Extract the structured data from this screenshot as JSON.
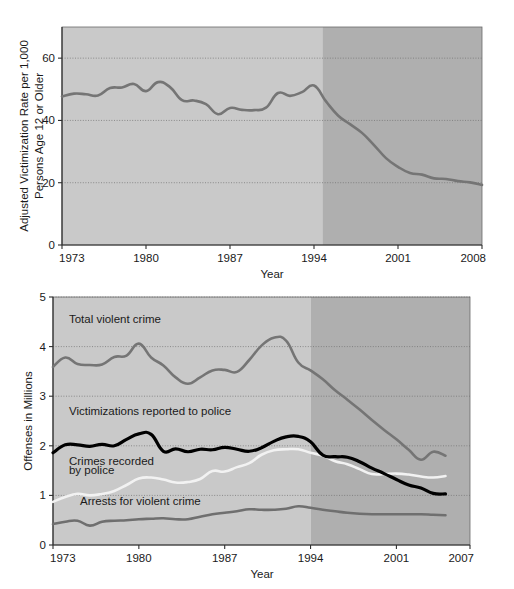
{
  "figure": {
    "title": "",
    "background": "#ffffff"
  },
  "colors": {
    "light_shade": "#c9c9c9",
    "dark_shade": "#afafaf",
    "axis": "#3a3a3a",
    "grid": "#8a8a8a",
    "line_gray": "#757575",
    "line_black": "#000000",
    "line_white": "#f2f2f2",
    "line_darkgray": "#6f6f6f"
  },
  "chart_data": [
    {
      "id": "top",
      "type": "line",
      "title": "",
      "xlabel": "Year",
      "ylabel": "Adjusted Victimization Rate per 1,000\nPersons Age 12 or Older",
      "ylabel_line1": "Adjusted Victimization Rate per 1,000",
      "ylabel_line2": "Persons Age 12 or Older",
      "xlim": [
        1973,
        2008
      ],
      "ylim": [
        0,
        70
      ],
      "xticks": [
        1973,
        1980,
        1987,
        1994,
        2001,
        2008
      ],
      "xticklabels": [
        "1973",
        "1980",
        "1987",
        "1994",
        "2001",
        "2008"
      ],
      "yticks": [
        0,
        20,
        40,
        60
      ],
      "yticklabels": [
        "0",
        "20",
        "40",
        "60"
      ],
      "grid": "horizontal-dotted",
      "legend": "none",
      "shading": {
        "light_range": [
          1973,
          1994.7
        ],
        "dark_range": [
          1994.7,
          2008
        ],
        "note": "light band = pre-redesign period, dark band = post-redesign period"
      },
      "series": [
        {
          "name": "Adjusted victimization rate",
          "color": "#757575",
          "x": [
            1973,
            1974,
            1975,
            1976,
            1977,
            1978,
            1979,
            1980,
            1981,
            1982,
            1983,
            1984,
            1985,
            1986,
            1987,
            1988,
            1989,
            1990,
            1991,
            1992,
            1993,
            1994,
            1995,
            1996,
            1997,
            1998,
            1999,
            2000,
            2001,
            2002,
            2003,
            2004,
            2005,
            2006,
            2007,
            2008
          ],
          "values": [
            47.7,
            48.6,
            48.4,
            48.0,
            50.4,
            50.6,
            51.7,
            49.4,
            52.3,
            50.7,
            46.5,
            46.4,
            45.2,
            42.0,
            44.0,
            43.4,
            43.3,
            44.1,
            48.8,
            47.9,
            49.1,
            51.2,
            46.1,
            41.6,
            38.8,
            36.0,
            32.1,
            27.9,
            25.1,
            23.1,
            22.6,
            21.4,
            21.2,
            20.5,
            20.1,
            19.3
          ]
        }
      ]
    },
    {
      "id": "bottom",
      "type": "line",
      "title": "",
      "xlabel": "Year",
      "ylabel": "Offenses in Millions",
      "xlim": [
        1973,
        2007
      ],
      "ylim": [
        0,
        5
      ],
      "xticks": [
        1973,
        1980,
        1987,
        1994,
        2001,
        2007
      ],
      "xticklabels": [
        "1973",
        "1980",
        "1987",
        "1994",
        "2001",
        "2007"
      ],
      "yticks": [
        0,
        1,
        2,
        3,
        4,
        5
      ],
      "yticklabels": [
        "0",
        "1",
        "2",
        "3",
        "4",
        "5"
      ],
      "grid": "horizontal-dotted",
      "legend": "inline-annotations",
      "shading": {
        "light_range": [
          1973,
          1994.0
        ],
        "dark_range": [
          1994.0,
          2007
        ]
      },
      "annotations": [
        {
          "text": "Total violent crime",
          "x": 1974.3,
          "y": 4.48
        },
        {
          "text": "Victimizations reported to police",
          "x": 1974.3,
          "y": 2.62
        },
        {
          "text": "Crimes recorded",
          "x": 1974.3,
          "y": 1.62
        },
        {
          "text": "by police",
          "x": 1974.3,
          "y": 1.43
        },
        {
          "text": "Arrests for violent crime",
          "x": 1975.2,
          "y": 0.8
        }
      ],
      "series": [
        {
          "name": "Total violent crime",
          "color": "#757575",
          "x": [
            1973,
            1974,
            1975,
            1976,
            1977,
            1978,
            1979,
            1980,
            1981,
            1982,
            1983,
            1984,
            1985,
            1986,
            1987,
            1988,
            1989,
            1990,
            1991,
            1992,
            1993,
            1994,
            1995,
            1996,
            1997,
            1998,
            1999,
            2000,
            2001,
            2002,
            2003,
            2004,
            2005
          ],
          "values": [
            3.59,
            3.78,
            3.65,
            3.63,
            3.64,
            3.79,
            3.82,
            4.06,
            3.78,
            3.62,
            3.38,
            3.25,
            3.38,
            3.52,
            3.53,
            3.49,
            3.73,
            4.02,
            4.18,
            4.12,
            3.68,
            3.52,
            3.34,
            3.12,
            2.93,
            2.73,
            2.52,
            2.32,
            2.13,
            1.92,
            1.72,
            1.88,
            1.8
          ]
        },
        {
          "name": "Victimizations reported to police",
          "color": "#000000",
          "x": [
            1973,
            1974,
            1975,
            1976,
            1977,
            1978,
            1979,
            1980,
            1981,
            1982,
            1983,
            1984,
            1985,
            1986,
            1987,
            1988,
            1989,
            1990,
            1991,
            1992,
            1993,
            1994,
            1995,
            1996,
            1997,
            1998,
            1999,
            2000,
            2001,
            2002,
            2003,
            2004,
            2005
          ],
          "values": [
            1.86,
            2.02,
            2.02,
            1.99,
            2.03,
            2.0,
            2.13,
            2.24,
            2.23,
            1.89,
            1.94,
            1.88,
            1.93,
            1.92,
            1.97,
            1.93,
            1.89,
            1.96,
            2.09,
            2.18,
            2.19,
            2.08,
            1.81,
            1.78,
            1.77,
            1.68,
            1.55,
            1.44,
            1.32,
            1.21,
            1.15,
            1.04,
            1.03
          ]
        },
        {
          "name": "Crimes recorded by police",
          "color": "#f2f2f2",
          "x": [
            1973,
            1974,
            1975,
            1976,
            1977,
            1978,
            1979,
            1980,
            1981,
            1982,
            1983,
            1984,
            1985,
            1986,
            1987,
            1988,
            1989,
            1990,
            1991,
            1992,
            1993,
            1994,
            1995,
            1996,
            1997,
            1998,
            1999,
            2000,
            2001,
            2002,
            2003,
            2004,
            2005
          ],
          "values": [
            0.87,
            0.97,
            1.03,
            1.0,
            1.03,
            1.09,
            1.21,
            1.34,
            1.36,
            1.32,
            1.26,
            1.27,
            1.33,
            1.49,
            1.48,
            1.57,
            1.65,
            1.82,
            1.91,
            1.93,
            1.93,
            1.86,
            1.8,
            1.69,
            1.63,
            1.53,
            1.43,
            1.43,
            1.44,
            1.42,
            1.38,
            1.36,
            1.39
          ]
        },
        {
          "name": "Arrests for violent crime",
          "color": "#6f6f6f",
          "x": [
            1973,
            1974,
            1975,
            1976,
            1977,
            1978,
            1979,
            1980,
            1981,
            1982,
            1983,
            1984,
            1985,
            1986,
            1987,
            1988,
            1989,
            1990,
            1991,
            1992,
            1993,
            1994,
            1995,
            1996,
            1997,
            1998,
            1999,
            2000,
            2001,
            2002,
            2003,
            2004,
            2005
          ],
          "values": [
            0.42,
            0.47,
            0.49,
            0.39,
            0.47,
            0.49,
            0.5,
            0.52,
            0.53,
            0.54,
            0.52,
            0.52,
            0.57,
            0.62,
            0.65,
            0.68,
            0.72,
            0.71,
            0.71,
            0.73,
            0.78,
            0.75,
            0.71,
            0.68,
            0.65,
            0.63,
            0.62,
            0.62,
            0.62,
            0.62,
            0.62,
            0.61,
            0.6
          ]
        }
      ]
    }
  ]
}
